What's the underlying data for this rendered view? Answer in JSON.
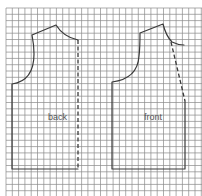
{
  "diagram": {
    "title": "",
    "grid": {
      "origin_x": 6,
      "origin_y": 8,
      "spacing": 6.3,
      "color": "#8a8a8a"
    },
    "pieces": [
      {
        "id": "back",
        "label": "back",
        "label_pos": [
          48,
          120
        ]
      },
      {
        "id": "front",
        "label": "front",
        "label_pos": [
          144,
          120
        ]
      }
    ],
    "colors": {
      "outline": "#3a3a3a",
      "background": "#ffffff",
      "label": "#555555"
    }
  }
}
